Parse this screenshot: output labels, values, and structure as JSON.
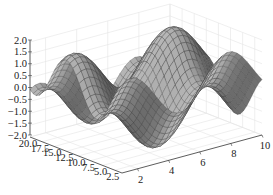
{
  "chart_data": {
    "type": "surface3d",
    "title": "",
    "xlabel": "",
    "ylabel": "",
    "zlabel": "",
    "x_ticks": [
      2,
      4,
      6,
      8,
      10
    ],
    "y_ticks": [
      2.5,
      5.0,
      7.5,
      10.0,
      12.5,
      15.0,
      17.5,
      20.0
    ],
    "z_ticks": [
      -2.0,
      -1.5,
      -1.0,
      -0.5,
      0.0,
      0.5,
      1.0,
      1.5,
      2.0
    ],
    "x_tick_labels": [
      "2",
      "4",
      "6",
      "8",
      "10"
    ],
    "y_tick_labels": [
      "2.5",
      "5.0",
      "7.5",
      "10.0",
      "12.5",
      "15.0",
      "17.5",
      "20.0"
    ],
    "z_tick_labels": [
      "−2.0",
      "−1.5",
      "−1.0",
      "−0.5",
      "0.0",
      "0.5",
      "1.0",
      "1.5",
      "2.0"
    ],
    "xlim": [
      1,
      10
    ],
    "ylim": [
      1,
      20
    ],
    "zlim": [
      -2.0,
      2.0
    ],
    "function_estimate": "z = sin(x) + cos(y / 2) (approximate shape)",
    "surface_color": "#8c8c8c",
    "edge_color": "#3a3a3a",
    "grid": true,
    "legend": null
  }
}
